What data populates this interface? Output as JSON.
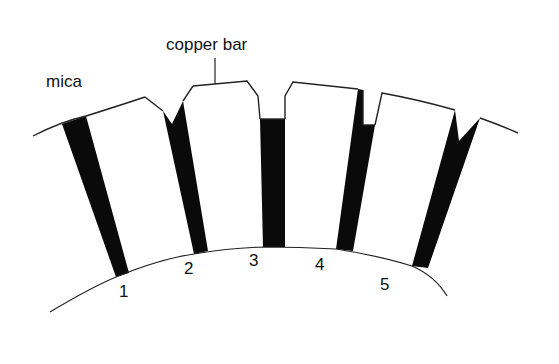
{
  "diagram": {
    "labels": {
      "mica": "mica",
      "copper_bar": "copper bar"
    },
    "segment_numbers": [
      "1",
      "2",
      "3",
      "4",
      "5"
    ],
    "colors": {
      "background": "#ffffff",
      "mica": "#0a0a0a",
      "outline": "#222222"
    }
  }
}
